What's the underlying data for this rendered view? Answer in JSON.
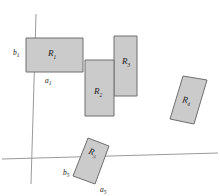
{
  "figure": {
    "background_color": "#ffffff",
    "fill_color": "#cbcbcb",
    "stroke_color": "#6e6e6e",
    "axis_color": "#9a9a9a",
    "width": 220,
    "height": 196
  },
  "axes": {
    "vertical": {
      "name": "vertical-axis",
      "x1": 36,
      "y1": 14,
      "x2": 31,
      "y2": 184
    },
    "horizontal": {
      "name": "horizontal-axis",
      "x1": 2,
      "y1": 159,
      "x2": 218,
      "y2": 153
    }
  },
  "rectangles": [
    {
      "id": "R1",
      "label": "R",
      "subscript": "1",
      "label_x": 52,
      "label_y": 56,
      "points": "26,38 83,38 83,72 26,72",
      "rotation": 0
    },
    {
      "id": "R2",
      "label": "R",
      "subscript": "2",
      "label_x": 98,
      "label_y": 94,
      "points": "85,60 114,60 114,116 85,116",
      "rotation": 0
    },
    {
      "id": "R3",
      "label": "R",
      "subscript": "3",
      "label_x": 122,
      "label_y": 64,
      "points": "114,36 137,36 137,96 114,96",
      "rotation": 0
    },
    {
      "id": "R4",
      "label": "R",
      "subscript": "4",
      "label_x": 182,
      "label_y": 103,
      "points": "183,76 207,80 194,124 170,119",
      "rotation": 0
    },
    {
      "id": "R5",
      "label": "R",
      "subscript": "5",
      "label_x": 88,
      "label_y": 155,
      "points": "88,138 109,146 95,184 73,176",
      "rotation": 0
    }
  ],
  "side_labels": [
    {
      "id": "b1",
      "letter": "b",
      "subscript": "1",
      "x": 13,
      "y": 54
    },
    {
      "id": "a1",
      "letter": "a",
      "subscript": "1",
      "x": 46,
      "y": 82
    },
    {
      "id": "b5",
      "letter": "b",
      "subscript": "5",
      "x": 64,
      "y": 174
    },
    {
      "id": "a5",
      "letter": "a",
      "subscript": "5",
      "x": 101,
      "y": 191
    }
  ]
}
